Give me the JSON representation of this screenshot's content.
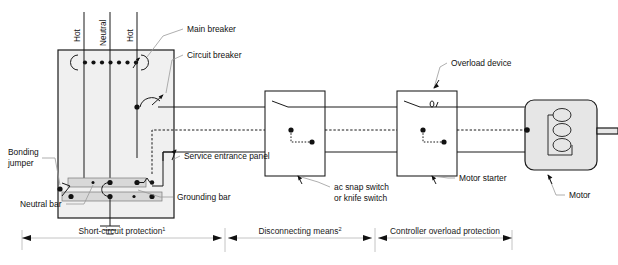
{
  "diagram": {
    "background_color": "#ffffff",
    "line_color": "#1a1a1a",
    "panel_fill_color": "#f0f0f0",
    "bar_fill_color": "#d8d8d8",
    "motor_fill_color": "#e6e6e6",
    "leader_color": "#9a9a9a"
  },
  "conductor_labels": [
    {
      "text": "Hot"
    },
    {
      "text": "Neutral"
    },
    {
      "text": "Hot"
    }
  ],
  "callouts": {
    "main_breaker": "Main breaker",
    "circuit_breaker": "Circuit breaker",
    "service_entrance_panel": "Service entrance panel",
    "bonding_jumper_line1": "Bonding",
    "bonding_jumper_line2": "jumper",
    "neutral_bar": "Neutral bar",
    "grounding_bar": "Grounding bar",
    "ac_snap_switch_line1": "ac snap switch",
    "ac_snap_switch_line2": "or knife switch",
    "motor_starter": "Motor starter",
    "overload_device": "Overload device",
    "motor": "Motor"
  },
  "zones": [
    {
      "label": "Short-circuit protection",
      "footnote": "1",
      "start_x": 22,
      "end_x": 222
    },
    {
      "label": "Disconnecting means",
      "footnote": "2",
      "start_x": 228,
      "end_x": 372
    },
    {
      "label": "Controller overload protection",
      "footnote": "",
      "start_x": 378,
      "end_x": 512
    }
  ],
  "components": {
    "service_panel": {
      "x": 58,
      "y": 50,
      "width": 116,
      "height": 168
    },
    "ac_snap_switch_box": {
      "x": 265,
      "y": 91,
      "width": 60,
      "height": 85
    },
    "motor_starter_box": {
      "x": 397,
      "y": 91,
      "width": 60,
      "height": 85
    },
    "motor": {
      "x": 525,
      "y": 100,
      "width": 72,
      "height": 70,
      "coil_loops": 3
    },
    "breaker_dots_count": 8
  }
}
